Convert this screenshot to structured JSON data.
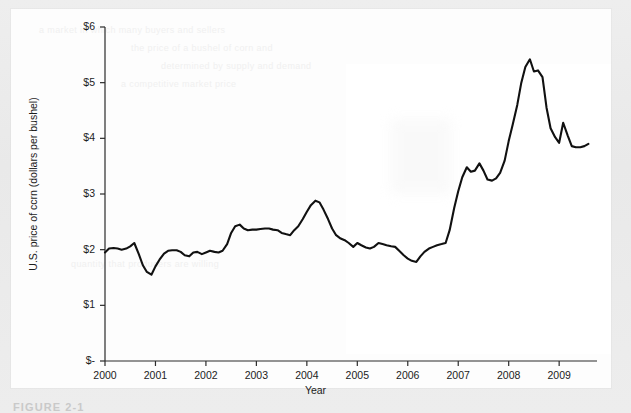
{
  "figure": {
    "caption": "FIGURE 2-1",
    "panel_background": "#fdfdfd",
    "scan_border_color": "#ececec"
  },
  "ghost_text": [
    "a market in which many buyers and sellers",
    "the price of a bushel of corn and",
    "determined by supply and demand",
    "a competitive market price",
    "quantity that producers are willing"
  ],
  "chart_data": {
    "type": "line",
    "title": "",
    "xlabel": "Year",
    "ylabel": "U.S. price of ccrn (dollars per bushel)",
    "line_color": "#111111",
    "line_width": 2.1,
    "grid": false,
    "legend": null,
    "xlim": [
      2000.0,
      2009.75
    ],
    "ylim": [
      0,
      6
    ],
    "xticks": [
      2000,
      2001,
      2002,
      2003,
      2004,
      2005,
      2006,
      2007,
      2008,
      2009
    ],
    "xtick_labels": [
      "2000",
      "2001",
      "2002",
      "2003",
      "2004",
      "2005",
      "2006",
      "2007",
      "2008",
      "2009"
    ],
    "yticks": [
      0,
      1,
      2,
      3,
      4,
      5,
      6
    ],
    "ytick_labels": [
      "$-",
      "$1",
      "$2",
      "$3",
      "$4",
      "$5",
      "$6"
    ],
    "series": [
      {
        "name": "U.S. price of corn",
        "units": "dollars per bushel",
        "x": [
          2000.0,
          2000.08,
          2000.17,
          2000.25,
          2000.33,
          2000.42,
          2000.5,
          2000.58,
          2000.67,
          2000.75,
          2000.83,
          2000.92,
          2001.0,
          2001.08,
          2001.17,
          2001.25,
          2001.33,
          2001.42,
          2001.5,
          2001.58,
          2001.67,
          2001.75,
          2001.83,
          2001.92,
          2002.0,
          2002.08,
          2002.17,
          2002.25,
          2002.33,
          2002.42,
          2002.5,
          2002.58,
          2002.67,
          2002.75,
          2002.83,
          2002.92,
          2003.0,
          2003.08,
          2003.17,
          2003.25,
          2003.33,
          2003.42,
          2003.5,
          2003.58,
          2003.67,
          2003.75,
          2003.83,
          2003.92,
          2004.0,
          2004.08,
          2004.17,
          2004.25,
          2004.33,
          2004.42,
          2004.5,
          2004.58,
          2004.67,
          2004.75,
          2004.83,
          2004.92,
          2005.0,
          2005.08,
          2005.17,
          2005.25,
          2005.33,
          2005.42,
          2005.5,
          2005.58,
          2005.67,
          2005.75,
          2005.83,
          2005.92,
          2006.0,
          2006.08,
          2006.17,
          2006.25,
          2006.33,
          2006.42,
          2006.5,
          2006.58,
          2006.67,
          2006.75,
          2006.83,
          2006.92,
          2007.0,
          2007.08,
          2007.17,
          2007.25,
          2007.33,
          2007.42,
          2007.5,
          2007.58,
          2007.67,
          2007.75,
          2007.83,
          2007.92,
          2008.0,
          2008.08,
          2008.17,
          2008.25,
          2008.33,
          2008.42,
          2008.5,
          2008.58,
          2008.67,
          2008.75,
          2008.83,
          2008.92,
          2009.0,
          2009.08,
          2009.17,
          2009.25,
          2009.33,
          2009.42,
          2009.5,
          2009.58
        ],
        "y": [
          1.95,
          2.02,
          2.03,
          2.02,
          2.0,
          2.02,
          2.06,
          2.12,
          1.92,
          1.72,
          1.6,
          1.55,
          1.7,
          1.82,
          1.93,
          1.98,
          1.99,
          1.99,
          1.96,
          1.9,
          1.88,
          1.95,
          1.96,
          1.92,
          1.95,
          1.98,
          1.96,
          1.95,
          1.98,
          2.1,
          2.3,
          2.42,
          2.45,
          2.38,
          2.35,
          2.36,
          2.36,
          2.37,
          2.38,
          2.38,
          2.36,
          2.35,
          2.3,
          2.28,
          2.26,
          2.35,
          2.42,
          2.55,
          2.68,
          2.8,
          2.88,
          2.85,
          2.72,
          2.55,
          2.38,
          2.26,
          2.2,
          2.17,
          2.12,
          2.05,
          2.12,
          2.08,
          2.04,
          2.02,
          2.05,
          2.12,
          2.1,
          2.08,
          2.06,
          2.05,
          1.98,
          1.9,
          1.84,
          1.8,
          1.78,
          1.88,
          1.96,
          2.02,
          2.05,
          2.08,
          2.1,
          2.12,
          2.35,
          2.75,
          3.05,
          3.3,
          3.48,
          3.4,
          3.42,
          3.55,
          3.42,
          3.26,
          3.24,
          3.28,
          3.38,
          3.6,
          3.95,
          4.25,
          4.6,
          5.0,
          5.28,
          5.42,
          5.2,
          5.22,
          5.1,
          4.55,
          4.18,
          4.02,
          3.92,
          4.28,
          4.05,
          3.86,
          3.84,
          3.84,
          3.86,
          3.9
        ]
      }
    ],
    "annotations": {
      "peak_value": 5.42,
      "peak_year": 2008.42,
      "trough_value": 1.55,
      "trough_year": 2000.92
    }
  }
}
